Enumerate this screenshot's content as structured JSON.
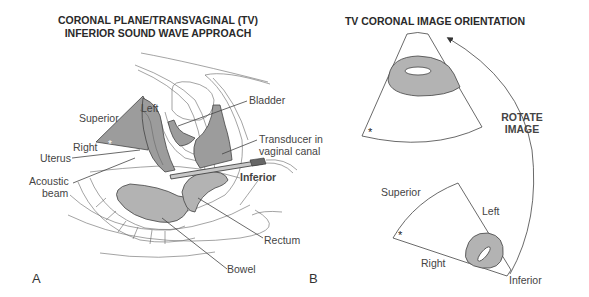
{
  "panel_a": {
    "title_line1": "CORONAL PLANE/TRANSVAGINAL (TV)",
    "title_line2": "INFERIOR SOUND WAVE APPROACH",
    "letter": "A",
    "labels": {
      "superior": "Superior",
      "left": "Left",
      "right": "Right",
      "uterus": "Uterus",
      "acoustic_beam_1": "Acoustic",
      "acoustic_beam_2": "beam",
      "bladder": "Bladder",
      "transducer_1": "Transducer in",
      "transducer_2": "vaginal canal",
      "inferior": "Inferior",
      "rectum": "Rectum",
      "bowel": "Bowel"
    },
    "marker": "*"
  },
  "panel_b": {
    "title": "TV CORONAL IMAGE ORIENTATION",
    "letter": "B",
    "rotate_1": "ROTATE",
    "rotate_2": "IMAGE",
    "labels": {
      "superior": "Superior",
      "left": "Left",
      "right": "Right",
      "inferior": "Inferior"
    },
    "marker_top": "*",
    "marker_bottom": "*"
  },
  "colors": {
    "organ_fill": "#9c9c9c",
    "light_fill": "#b3b3b3",
    "line": "#444444"
  }
}
